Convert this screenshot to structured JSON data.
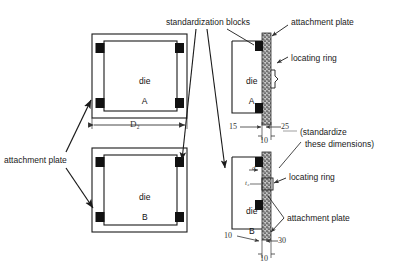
{
  "figure": {
    "ink_color": "#1a1a1a",
    "block_color": "#111111",
    "plate_fill": "#b9b9b9"
  },
  "plan_views": [
    {
      "id": "die-a-plan",
      "line1": "die",
      "line2": "A",
      "dimension": "D₂"
    },
    {
      "id": "die-b-plan",
      "line1": "die",
      "line2": "B"
    }
  ],
  "section_views": [
    {
      "id": "die-a-section",
      "line1": "die",
      "line2": "A",
      "dimensions": [
        "15",
        "25",
        "10"
      ]
    },
    {
      "id": "die-b-section",
      "line1": "die",
      "line2": "B",
      "dimensions": [
        "10",
        "30",
        "10"
      ],
      "small_labels": [
        "d",
        "t₂"
      ]
    }
  ],
  "callouts": {
    "standardization_blocks": "standardization blocks",
    "attachment_plate_top": "attachment plate",
    "attachment_plate_left": "attachment plate",
    "attachment_plate_bottom": "attachment plate",
    "locating_ring_top": "locating ring",
    "locating_ring_bottom": "locating ring",
    "standardize_line1": "(standardize",
    "standardize_line2": "these dimensions)"
  }
}
